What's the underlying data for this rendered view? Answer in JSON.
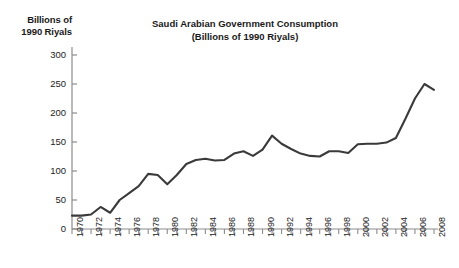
{
  "figure": {
    "axis_caption": "Billions of\n1990 Riyals",
    "title_line1": "Saudi Arabian Government Consumption",
    "title_line2": "(Billions of 1990 Riyals)",
    "line_color": "#3a3a3a",
    "axis_color": "#8c8c8c",
    "background": "#ffffff"
  },
  "chart_data": {
    "type": "line",
    "xlabel": "",
    "ylabel": "Billions of 1990 Riyals",
    "ylim": [
      0,
      315
    ],
    "xlim": [
      1970,
      2008
    ],
    "yticks": [
      0,
      50,
      100,
      150,
      200,
      250,
      300
    ],
    "ytick_labels": [
      "0",
      "50",
      "100",
      "150",
      "200",
      "250",
      "300"
    ],
    "xtick_labels": [
      "1970",
      "1972",
      "1974",
      "1976",
      "1978",
      "1980",
      "1982",
      "1984",
      "1986",
      "1988",
      "1990",
      "1992",
      "1994",
      "1996",
      "1998",
      "2000",
      "2002",
      "2004",
      "2006",
      "2008"
    ],
    "grid": false,
    "legend": null,
    "x": [
      1970,
      1971,
      1972,
      1973,
      1974,
      1975,
      1976,
      1977,
      1978,
      1979,
      1980,
      1981,
      1982,
      1983,
      1984,
      1985,
      1986,
      1987,
      1988,
      1989,
      1990,
      1991,
      1992,
      1993,
      1994,
      1995,
      1996,
      1997,
      1998,
      1999,
      2000,
      2001,
      2002,
      2003,
      2004,
      2005,
      2006,
      2007,
      2008
    ],
    "values": [
      23,
      23,
      25,
      38,
      28,
      50,
      62,
      74,
      95,
      93,
      77,
      93,
      112,
      119,
      121,
      118,
      119,
      130,
      134,
      126,
      137,
      161,
      147,
      138,
      130,
      126,
      125,
      134,
      134,
      131,
      146,
      147,
      147,
      149,
      157,
      190,
      225,
      250,
      240
    ],
    "series_name": "Government Consumption"
  }
}
